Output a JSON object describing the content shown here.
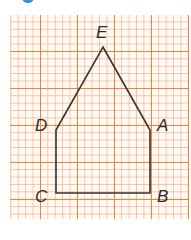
{
  "figure": {
    "badge_color": "#3a8fd6",
    "grid_color": "#ee7828",
    "line_color": "#333333"
  },
  "points": {
    "E": {
      "label": "E",
      "x": 103,
      "y": 47
    },
    "D": {
      "label": "D",
      "x": 56,
      "y": 130
    },
    "A": {
      "label": "A",
      "x": 150,
      "y": 130
    },
    "C": {
      "label": "C",
      "x": 56,
      "y": 193
    },
    "B": {
      "label": "B",
      "x": 150,
      "y": 193
    }
  },
  "shape": {
    "type": "pentagon",
    "vertices_order": [
      "E",
      "A",
      "B",
      "C",
      "D"
    ]
  }
}
